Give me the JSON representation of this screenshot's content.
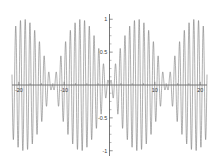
{
  "chart_data": {
    "type": "line",
    "title": "",
    "subtitle": "",
    "xlabel": "",
    "ylabel": "",
    "xlim": [
      -21.5,
      21.5
    ],
    "ylim": [
      -1.08,
      1.08
    ],
    "grid": false,
    "legend": null,
    "legend_position": "none",
    "frame": false,
    "axis_style": "crossed-axes-at-origin",
    "curve_color": "#6e6e6e",
    "axis_color": "#4a4a4a",
    "background_color": "#ffffff",
    "annotations": [],
    "x_ticks": [
      -20,
      -10,
      10,
      20
    ],
    "x_tick_labels": [
      "-20",
      "-10",
      "10",
      "20"
    ],
    "x_minor_ticks": [
      -17.5,
      -15,
      -12.5,
      -7.5,
      -5,
      -2.5,
      2.5,
      5,
      7.5,
      12.5,
      15,
      17.5
    ],
    "y_ticks": [
      -1,
      -0.5,
      0.5,
      1
    ],
    "y_tick_labels": [
      "-1",
      "-0.5",
      "0.5",
      "1"
    ],
    "y_minor_ticks": [
      -0.875,
      -0.75,
      -0.625,
      -0.375,
      -0.25,
      -0.125,
      0.125,
      0.25,
      0.375,
      0.625,
      0.75,
      0.875
    ],
    "series": [
      {
        "name": "beat waveform",
        "color": "#6e6e6e",
        "formula": "sin(x/4) * sin(6*x)",
        "envelope": "|sin(x/4)|",
        "carrier_frequency": 6.0,
        "envelope_frequency": 0.25,
        "amplitude_max": 1,
        "amplitude_min": -1,
        "sample_count": 2400,
        "x_start": -21.5,
        "x_end": 21.5
      }
    ],
    "envelope_nodes": [
      {
        "x": -20,
        "amplitude": 0
      },
      {
        "x": -10,
        "amplitude": 1
      },
      {
        "x": 0,
        "amplitude": 0
      },
      {
        "x": 10,
        "amplitude": 1
      },
      {
        "x": 20,
        "amplitude": 0
      }
    ]
  }
}
